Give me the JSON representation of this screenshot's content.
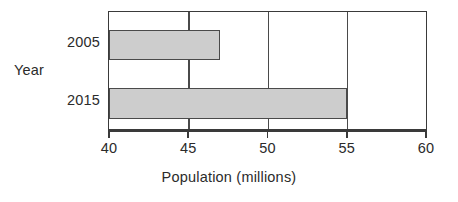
{
  "chart_data": {
    "type": "bar",
    "orientation": "horizontal",
    "title": "",
    "xlabel": "Population (millions)",
    "ylabel": "Year",
    "categories": [
      "2005",
      "2015"
    ],
    "values": [
      47,
      55
    ],
    "series": [
      {
        "name": "Population",
        "values": [
          47,
          55
        ]
      }
    ],
    "xlim": [
      40,
      60
    ],
    "xticks": [
      40,
      45,
      50,
      55,
      60
    ],
    "xtick_labels": [
      "40",
      "45",
      "50",
      "55",
      "60"
    ],
    "grid": true,
    "grid_axis": "x",
    "legend": false,
    "legend_position": "none",
    "colors": {
      "bar_fill": "#cdcdcd",
      "bar_border": "#4a4a4a",
      "axis": "#3a3a3a",
      "grid": "#4a4a4a",
      "text": "#2b2b2b",
      "background": "#ffffff"
    }
  }
}
